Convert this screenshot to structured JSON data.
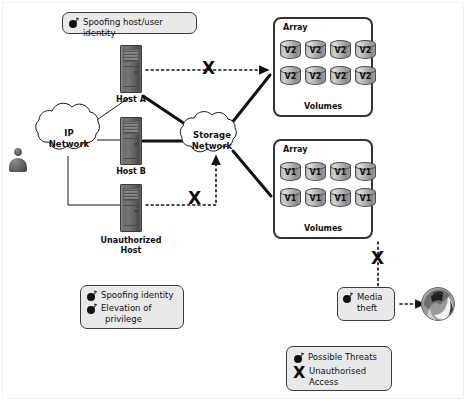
{
  "diagram": {
    "background": "#ffffff",
    "frame_color": "#f2f2f2"
  },
  "nodes": {
    "ip_network": {
      "line1": "IP",
      "line2": "Network"
    },
    "storage_network": {
      "line1": "Storage",
      "line2": "Network"
    },
    "host_a": {
      "label": "Host A"
    },
    "host_b": {
      "label": "Host B"
    },
    "unauthorized_host": {
      "line1": "Unauthorized",
      "line2": "Host"
    },
    "user": {
      "name": "user-actor"
    }
  },
  "arrays": [
    {
      "title": "Array",
      "volumes_label": "Volumes",
      "volumes": [
        "V2",
        "V2",
        "V2",
        "V2",
        "V2",
        "V2",
        "V2",
        "V2"
      ]
    },
    {
      "title": "Array",
      "volumes_label": "Volumes",
      "volumes": [
        "V1",
        "V1",
        "V1",
        "V1",
        "V1",
        "V1",
        "V1",
        "V1"
      ]
    }
  ],
  "callouts": {
    "spoofing_host_user": {
      "icon": "bomb-icon",
      "lines": [
        "Spoofing host/user identity"
      ]
    },
    "unauthorized_threats": {
      "items": [
        {
          "icon": "bomb-icon",
          "lines": [
            "Spoofing identity"
          ]
        },
        {
          "icon": "bomb-icon",
          "lines": [
            "Elevation of",
            "privilege"
          ]
        }
      ]
    },
    "media_theft": {
      "icon": "bomb-icon",
      "lines": [
        "Media",
        "theft"
      ]
    }
  },
  "legend": {
    "items": [
      {
        "icon": "bomb-icon",
        "lines": [
          "Possible Threats"
        ]
      },
      {
        "icon": "x-icon",
        "lines": [
          "Unauthorised",
          "Access"
        ]
      }
    ]
  },
  "markers": {
    "x_symbol": "X",
    "x_host_a_to_array2": "X",
    "x_unauthorized_to_storage": "X",
    "x_array1_to_media": "X"
  }
}
